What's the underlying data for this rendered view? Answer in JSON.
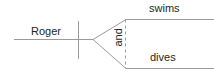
{
  "diagram": {
    "type": "syntax-coordination-tree",
    "subject": "Roger",
    "conjunction": "and",
    "predicates": [
      "swims",
      "dives"
    ],
    "colors": {
      "line": "#9a9a9a",
      "text": "#231f20",
      "background": "#ffffff"
    }
  }
}
